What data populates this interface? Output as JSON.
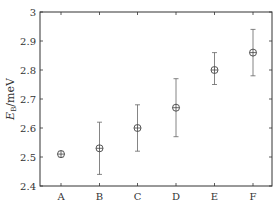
{
  "chart_data": {
    "type": "scatter",
    "title": "",
    "xlabel": "",
    "ylabel": "E_B/meV",
    "ylabel_main": "E",
    "ylabel_sub": "B",
    "ylabel_unit": "/meV",
    "categories": [
      "A",
      "B",
      "C",
      "D",
      "E",
      "F"
    ],
    "values": [
      2.51,
      2.53,
      2.6,
      2.67,
      2.8,
      2.86
    ],
    "error_low": [
      2.5,
      2.44,
      2.52,
      2.57,
      2.75,
      2.78
    ],
    "error_high": [
      2.52,
      2.62,
      2.68,
      2.77,
      2.86,
      2.94
    ],
    "ylim": [
      2.4,
      3.0
    ],
    "yticks": [
      2.4,
      2.5,
      2.6,
      2.7,
      2.8,
      2.9,
      3.0
    ],
    "ytick_labels": [
      "2.4",
      "2.5",
      "2.6",
      "2.7",
      "2.8",
      "2.9",
      "3"
    ],
    "grid": false,
    "legend": null,
    "marker": "circle-with-cross",
    "colors": {
      "axis": "#333333",
      "marker": "#444444",
      "errorbar": "#666666"
    }
  }
}
